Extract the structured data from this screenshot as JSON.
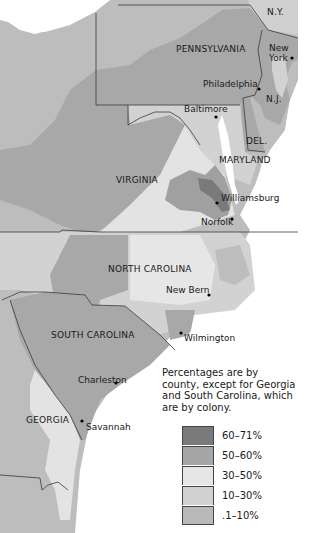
{
  "map": {
    "labels": {
      "states": {
        "ny": "N.Y.",
        "pennsylvania": "PENNSYLVANIA",
        "nj": "N.J.",
        "delaware": "DEL.",
        "maryland": "MARYLAND",
        "virginia": "VIRGINIA",
        "north_carolina": "NORTH CAROLINA",
        "south_carolina": "SOUTH CAROLINA",
        "georgia": "GEORGIA"
      },
      "cities": {
        "new_york": "New York",
        "philadelphia": "Philadelphia",
        "baltimore": "Baltimore",
        "williamsburg": "Williamsburg",
        "norfolk": "Norfolk",
        "new_bern": "New Bern",
        "wilmington": "Wilmington",
        "charleston": "Charleston",
        "savannah": "Savannah"
      }
    },
    "note": "Percentages are by county, except for Georgia and South Carolina, which are by colony.",
    "legend": [
      {
        "label": "60–71%",
        "color": "#7a7a7a"
      },
      {
        "label": "50–60%",
        "color": "#a6a6a6"
      },
      {
        "label": "30–50%",
        "color": "#e6e6e6"
      },
      {
        "label": "10–30%",
        "color": "#d2d2d2"
      },
      {
        "label": ".1–10%",
        "color": "#b9b9b9"
      }
    ],
    "colors": {
      "water": "#ffffff",
      "border": "#3a3a3a"
    }
  }
}
